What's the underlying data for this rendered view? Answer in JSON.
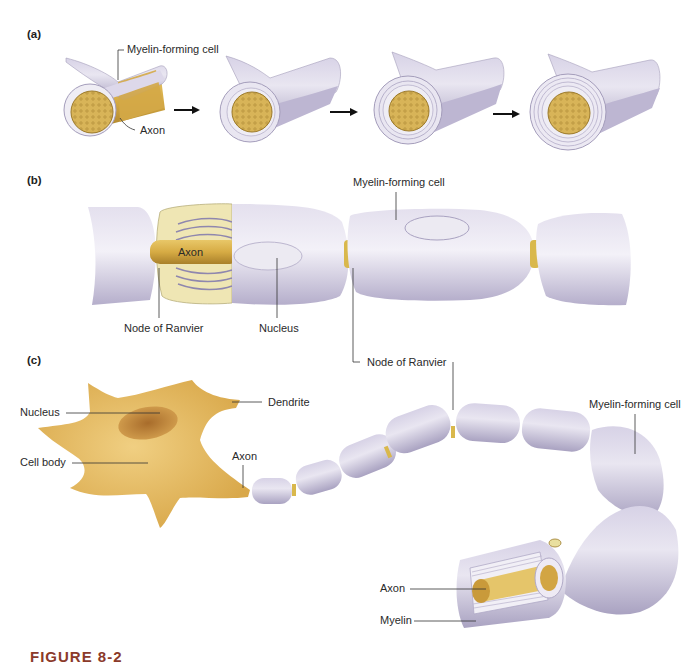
{
  "figure": {
    "caption": "FIGURE 8-2",
    "colors": {
      "myelin": "#cdc8dd",
      "myelin_light": "#eeebf4",
      "myelin_dark": "#9d96b6",
      "axon": "#d9b048",
      "axon_dark": "#b78a2a",
      "cell_body": "#e2b55a",
      "nucleus": "#b07a33",
      "caption": "#8b3a2a"
    }
  },
  "panel_a": {
    "tag": "(a)",
    "labels": {
      "myelin_forming_cell": "Myelin-forming cell",
      "axon": "Axon"
    },
    "stages": 4,
    "arrows": 3
  },
  "panel_b": {
    "tag": "(b)",
    "labels": {
      "axon": "Axon",
      "node_of_ranvier_left": "Node of Ranvier",
      "nucleus": "Nucleus",
      "myelin_forming_cell": "Myelin-forming cell",
      "node_of_ranvier_right": "Node of Ranvier"
    }
  },
  "panel_c": {
    "tag": "(c)",
    "labels": {
      "nucleus": "Nucleus",
      "dendrite": "Dendrite",
      "cell_body": "Cell body",
      "axon_hillock": "Axon",
      "myelin_forming_cell": "Myelin-forming cell",
      "axon_cutaway": "Axon",
      "myelin": "Myelin"
    }
  }
}
